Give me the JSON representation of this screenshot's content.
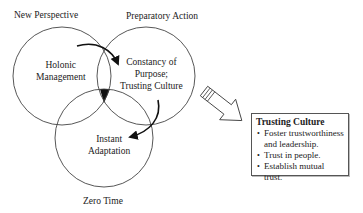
{
  "diagram": {
    "circles": [
      {
        "id": "new-perspective",
        "outer_label": "New Perspective",
        "inner_label_lines": [
          "Holonic",
          "Management"
        ]
      },
      {
        "id": "preparatory-action",
        "outer_label": "Preparatory Action",
        "inner_label_lines": [
          "Constancy of",
          "Purpose;",
          "Trusting Culture"
        ]
      },
      {
        "id": "zero-time",
        "outer_label": "Zero Time",
        "inner_label_lines": [
          "Instant",
          "Adaptation"
        ]
      }
    ],
    "callout": {
      "title": "Trusting Culture",
      "bullets": [
        "Foster trustworthiness and leadership.",
        "Trust in people.",
        "Establish mutual trust."
      ],
      "bullet_lines": [
        [
          "Foster trustworthiness",
          "and leadership."
        ],
        [
          "Trust in people."
        ],
        [
          "Establish mutual trust."
        ]
      ]
    },
    "colors": {
      "stroke": "#333333",
      "fill_center": "#111111",
      "background": "#ffffff"
    }
  }
}
